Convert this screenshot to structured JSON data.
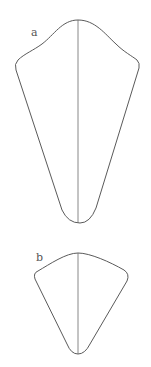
{
  "figure": {
    "panels": [
      {
        "label": "a",
        "description": "Elongated kite-shaped outline with rounded apex and a vertical midline"
      },
      {
        "label": "b",
        "description": "Shorter fan/kite-shaped outline with a vertical midline"
      }
    ],
    "colors": {
      "stroke": "#5a5a5a",
      "background": "#ffffff"
    }
  }
}
